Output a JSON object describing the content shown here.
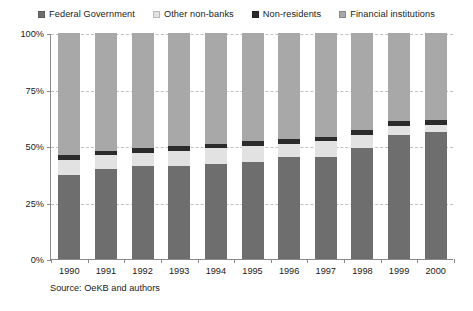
{
  "chart_data": {
    "type": "bar",
    "stacked": true,
    "stack_mode": "percent",
    "title": "",
    "subtitle": "",
    "xlabel": "",
    "ylabel": "",
    "ylim": [
      0,
      100
    ],
    "yticks": [
      0,
      25,
      50,
      75,
      100
    ],
    "ytick_labels": [
      "0%",
      "25%",
      "50%",
      "75%",
      "100%"
    ],
    "grid": true,
    "grid_style": "dashed-horizontal",
    "legend_position": "top",
    "categories": [
      "1990",
      "1991",
      "1992",
      "1993",
      "1994",
      "1995",
      "1996",
      "1997",
      "1998",
      "1999",
      "2000"
    ],
    "series": [
      {
        "name": "Federal Government",
        "color": "#6e6e6e",
        "values": [
          37,
          40,
          41,
          41,
          42,
          43,
          45,
          45,
          49,
          55,
          56
        ]
      },
      {
        "name": "Other non-banks",
        "color": "#e2e2e2",
        "values": [
          7,
          6,
          6,
          7,
          7,
          7,
          6,
          7,
          6,
          4,
          3.5
        ]
      },
      {
        "name": "Non-residents",
        "color": "#2b2b2b",
        "values": [
          2,
          2,
          2,
          2,
          2,
          2,
          2,
          2,
          2,
          2,
          2
        ]
      },
      {
        "name": "Financial institutions",
        "color": "#a8a8a8",
        "values": [
          54,
          52,
          51,
          50,
          49,
          48,
          47,
          46,
          43,
          39,
          38.5
        ]
      }
    ],
    "cumulative_tops": {
      "Federal Government": [
        37,
        40,
        41,
        41,
        42,
        43,
        45,
        45,
        49,
        55,
        56
      ],
      "Other non-banks": [
        44,
        46,
        47,
        48,
        49,
        50,
        51,
        52,
        55,
        59,
        59.5
      ],
      "Non-residents": [
        46,
        48,
        49,
        50,
        51,
        52,
        53,
        54,
        57,
        61,
        61.5
      ],
      "Financial institutions": [
        100,
        100,
        100,
        100,
        100,
        100,
        100,
        100,
        100,
        100,
        100
      ]
    },
    "source": "Source: OeKB and authors"
  },
  "legend": {
    "items": [
      {
        "label": "Federal Government",
        "color": "#6e6e6e",
        "icon": "legend-swatch-icon"
      },
      {
        "label": "Other non-banks",
        "color": "#e2e2e2",
        "icon": "legend-swatch-icon"
      },
      {
        "label": "Non-residents",
        "color": "#2b2b2b",
        "icon": "legend-swatch-icon"
      },
      {
        "label": "Financial institutions",
        "color": "#a8a8a8",
        "icon": "legend-swatch-icon"
      }
    ]
  },
  "axes": {
    "y_labels": [
      "100%",
      "75%",
      "50%",
      "25%",
      "0%"
    ],
    "x_labels": [
      "1990",
      "1991",
      "1992",
      "1993",
      "1994",
      "1995",
      "1996",
      "1997",
      "1998",
      "1999",
      "2000"
    ]
  },
  "footer": {
    "source": "Source: OeKB and authors"
  },
  "colors": {
    "axis": "#8a8a8a",
    "grid": "#c2c2c2",
    "text": "#1a1a1a",
    "background": "#ffffff"
  }
}
